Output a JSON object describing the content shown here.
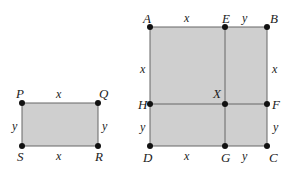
{
  "colors": {
    "fill": "#cfcfcf",
    "stroke": "#666666",
    "point": "#111111"
  },
  "small_rect": {
    "vertices": {
      "P": "P",
      "Q": "Q",
      "R": "R",
      "S": "S"
    },
    "sides": {
      "top": "x",
      "bottom": "x",
      "left": "y",
      "right": "y"
    }
  },
  "large_rect": {
    "vertices": {
      "A": "A",
      "E": "E",
      "B": "B",
      "H": "H",
      "X": "X",
      "F": "F",
      "D": "D",
      "G": "G",
      "C": "C"
    },
    "sides": {
      "AE": "x",
      "EB": "y",
      "left_upper": "x",
      "right_upper": "x",
      "left_lower": "y",
      "right_lower": "y",
      "DG": "x",
      "GC": "y"
    }
  }
}
